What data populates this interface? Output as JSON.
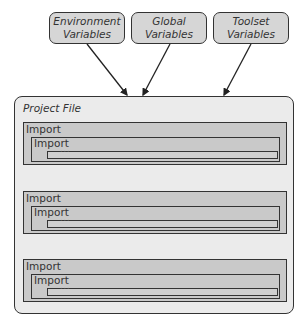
{
  "variables": [
    {
      "line1": "Environment",
      "line2": "Variables"
    },
    {
      "line1": "Global",
      "line2": "Variables"
    },
    {
      "line1": "Toolset",
      "line2": "Variables"
    }
  ],
  "project": {
    "title": "Project File",
    "imports": [
      {
        "outer": "Import",
        "inner": "Import",
        "nested": "..."
      },
      {
        "outer": "Import",
        "inner": "Import",
        "nested": "..."
      },
      {
        "outer": "Import",
        "inner": "Import",
        "nested": "..."
      }
    ]
  }
}
